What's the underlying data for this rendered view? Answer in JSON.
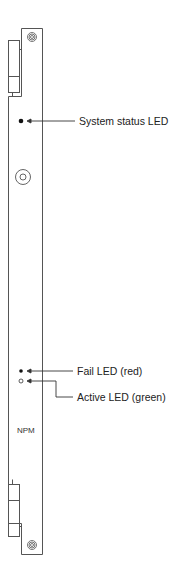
{
  "module": {
    "name": "NPM",
    "colors": {
      "line": "#555555",
      "led_fill": "#111111",
      "background": "#ffffff"
    }
  },
  "callouts": [
    {
      "id": "system-status-led",
      "label": "System status LED"
    },
    {
      "id": "fail-led",
      "label": "Fail LED (red)"
    },
    {
      "id": "active-led",
      "label": "Active LED (green)"
    }
  ]
}
